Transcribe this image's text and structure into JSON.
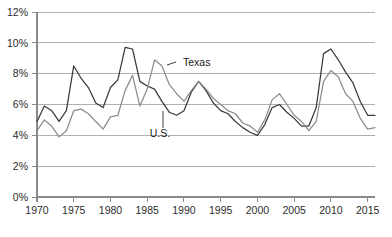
{
  "chart_data": {
    "type": "line",
    "title": "",
    "subtitle": "",
    "xlabel": "",
    "ylabel": "",
    "xlim": [
      1970,
      2016
    ],
    "ylim": [
      0,
      12
    ],
    "grid": true,
    "legend_position": "inline-annotation",
    "x_tick_labels": [
      "1970",
      "1975",
      "1980",
      "1985",
      "1990",
      "1995",
      "2000",
      "2005",
      "2010",
      "2015"
    ],
    "x_ticks": [
      1970,
      1975,
      1980,
      1985,
      1990,
      1995,
      2000,
      2005,
      2010,
      2015
    ],
    "y_tick_labels": [
      "0%",
      "2%",
      "4%",
      "6%",
      "8%",
      "10%",
      "12%"
    ],
    "y_ticks": [
      0,
      2,
      4,
      6,
      8,
      10,
      12
    ],
    "x": [
      1970,
      1971,
      1972,
      1973,
      1974,
      1975,
      1976,
      1977,
      1978,
      1979,
      1980,
      1981,
      1982,
      1983,
      1984,
      1985,
      1986,
      1987,
      1988,
      1989,
      1990,
      1991,
      1992,
      1993,
      1994,
      1995,
      1996,
      1997,
      1998,
      1999,
      2000,
      2001,
      2002,
      2003,
      2004,
      2005,
      2006,
      2007,
      2008,
      2009,
      2010,
      2011,
      2012,
      2013,
      2014,
      2015,
      2016
    ],
    "series": [
      {
        "name": "U.S.",
        "color": "#3a3a3a",
        "values": [
          4.9,
          5.9,
          5.6,
          4.9,
          5.6,
          8.5,
          7.7,
          7.1,
          6.1,
          5.8,
          7.1,
          7.6,
          9.7,
          9.6,
          7.5,
          7.2,
          7.0,
          6.2,
          5.5,
          5.3,
          5.6,
          6.8,
          7.5,
          6.9,
          6.1,
          5.6,
          5.4,
          4.9,
          4.5,
          4.2,
          4.0,
          4.7,
          5.8,
          6.0,
          5.5,
          5.1,
          4.6,
          4.6,
          5.8,
          9.3,
          9.6,
          8.9,
          8.1,
          7.4,
          6.2,
          5.3,
          5.3
        ]
      },
      {
        "name": "Texas",
        "color": "#8c8c8c",
        "values": [
          4.3,
          5.0,
          4.6,
          3.9,
          4.3,
          5.6,
          5.7,
          5.4,
          4.9,
          4.4,
          5.2,
          5.3,
          6.9,
          7.9,
          5.9,
          7.0,
          8.9,
          8.5,
          7.3,
          6.7,
          6.2,
          6.9,
          7.5,
          7.0,
          6.4,
          6.0,
          5.6,
          5.4,
          4.8,
          4.6,
          4.2,
          5.0,
          6.3,
          6.7,
          6.0,
          5.3,
          4.9,
          4.3,
          4.9,
          7.5,
          8.2,
          7.8,
          6.7,
          6.2,
          5.1,
          4.4,
          4.5
        ]
      }
    ],
    "annotations": [
      {
        "label": "Texas",
        "series": "Texas",
        "x_px": 183,
        "y_px": 66
      },
      {
        "label": "U.S.",
        "series": "U.S.",
        "x_px": 160,
        "y_px": 137
      }
    ]
  }
}
